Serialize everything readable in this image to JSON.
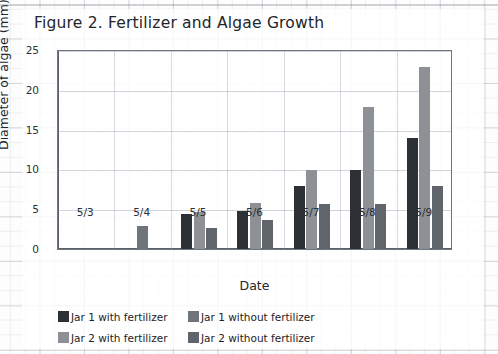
{
  "figure": {
    "title": "Figure 2. Fertilizer and Algae Growth"
  },
  "chart_data": {
    "type": "bar",
    "title": "Figure 2. Fertilizer and Algae Growth",
    "xlabel": "Date",
    "ylabel": "Diameter of algae (mm)",
    "categories": [
      "5/3",
      "5/4",
      "5/5",
      "5/6",
      "5/7",
      "5/8",
      "5/9"
    ],
    "ylim": [
      0,
      25
    ],
    "yticks": [
      0,
      5,
      10,
      15,
      20,
      25
    ],
    "ytick_labels": [
      "0",
      "5",
      "10",
      "15",
      "20",
      "25"
    ],
    "grid": true,
    "legend_position": "bottom-left",
    "series": [
      {
        "name": "Jar 1 with fertilizer",
        "color": "#2d3034",
        "values": [
          0,
          0,
          4.4,
          4.8,
          7.9,
          9.9,
          13.9
        ]
      },
      {
        "name": "Jar 2 with fertilizer",
        "color": "#8d9196",
        "values": [
          0,
          0,
          4.7,
          5.8,
          9.9,
          17.8,
          22.9
        ]
      },
      {
        "name": "Jar 1 without fertilizer",
        "color": "#6f757b",
        "values": [
          0,
          2.9,
          0,
          0,
          0,
          0,
          0
        ]
      },
      {
        "name": "Jar 2 without fertilizer",
        "color": "#5f656b",
        "values": [
          0,
          0,
          2.7,
          3.7,
          5.7,
          5.7,
          7.9
        ]
      }
    ]
  },
  "legend": {
    "items": [
      {
        "label": "Jar 1 with fertilizer",
        "color": "#2d3034"
      },
      {
        "label": "Jar 1 without fertilizer",
        "color": "#6f757b"
      },
      {
        "label": "Jar 2 with fertilizer",
        "color": "#8d9196"
      },
      {
        "label": "Jar 2 without fertilizer",
        "color": "#5f656b"
      }
    ]
  }
}
